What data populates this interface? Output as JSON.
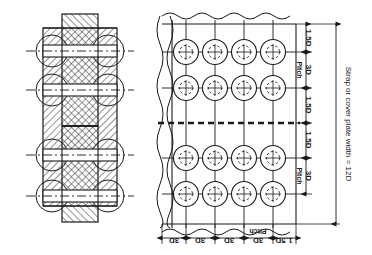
{
  "figure": {
    "type": "engineering-drawing",
    "views": [
      {
        "name": "sectional-elevation",
        "position": "left"
      },
      {
        "name": "plan-view",
        "position": "right"
      }
    ]
  },
  "plan_view": {
    "rivet_rows": 4,
    "rivet_columns": 4,
    "rivet_count": 16,
    "joint_centerline_style": "dashed",
    "break_line_edges": [
      "left",
      "right",
      "top",
      "bottom"
    ]
  },
  "vertical_dimensions": {
    "segments": [
      {
        "id": "v1",
        "label": "1.5D"
      },
      {
        "id": "v2",
        "label": "3D",
        "note": "Pitch"
      },
      {
        "id": "v3",
        "label": "1.5D"
      },
      {
        "id": "v4",
        "label": "1.5D"
      },
      {
        "id": "v5",
        "label": "3D",
        "note": "Pitch"
      }
    ],
    "pitch_label": "Pitch",
    "overall": "Strap or cover plate width = 12D"
  },
  "horizontal_dimensions": {
    "segments": [
      {
        "id": "h1",
        "label": "3D"
      },
      {
        "id": "h2",
        "label": "3D"
      },
      {
        "id": "h3",
        "label": "3D",
        "note": "Pitch"
      },
      {
        "id": "h4",
        "label": "1.5D"
      }
    ],
    "pitch_label": "Pitch"
  },
  "labels": {
    "d_15": "1.5D",
    "d_3": "3D",
    "pitch": "Pitch",
    "strap_width": "Strap or cover plate width = 12D"
  },
  "colors": {
    "line": "#1a1a1a",
    "hatch": "#3a3a3a",
    "background": "#ffffff"
  }
}
